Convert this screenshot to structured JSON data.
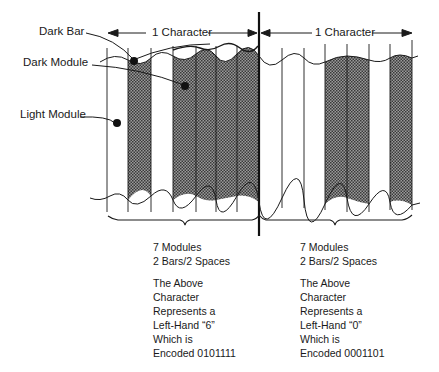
{
  "labels": {
    "dark_bar": "Dark Bar",
    "dark_module": "Dark Module",
    "light_module": "Light Module",
    "char_left": "1 Character",
    "char_right": "1 Character"
  },
  "characters": [
    {
      "modules": "7 Modules",
      "bars_spaces": "2 Bars/2 Spaces",
      "line1": "The Above",
      "line2": "Character",
      "line3": "Represents a",
      "line4": "Left-Hand “6”",
      "line5": "Which is",
      "line6": "Encoded 0101111",
      "encoding": "0101111"
    },
    {
      "modules": "7 Modules",
      "bars_spaces": "2 Bars/2 Spaces",
      "line1": "The Above",
      "line2": "Character",
      "line3": "Represents a",
      "line4": "Left-Hand “0”",
      "line5": "Which is",
      "line6": "Encoded 0001101",
      "encoding": "0001101"
    }
  ],
  "colors": {
    "ink": "#1a1a1a",
    "dark_module_fill": "#7a7a7a"
  }
}
